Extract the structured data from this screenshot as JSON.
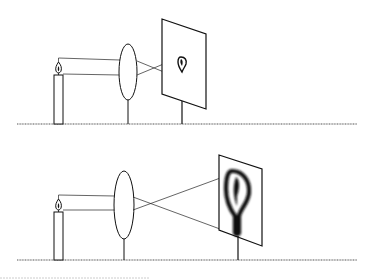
{
  "figure": {
    "panels": [
      {
        "id": "top",
        "description": "Candle, convex lens and screen; small sharp inverted image of flame on screen",
        "image_size": "small"
      },
      {
        "id": "bottom",
        "description": "Candle, convex lens and screen moved farther away; large blurred inverted image of flame on screen",
        "image_size": "large"
      }
    ]
  },
  "colors": {
    "ink": "#111111",
    "ground": "#555555",
    "background": "#ffffff"
  }
}
